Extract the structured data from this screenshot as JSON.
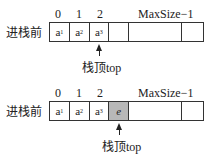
{
  "rows": [
    {
      "label": "进栈前",
      "indices": [
        "0",
        "1",
        "2"
      ],
      "max_label": "MaxSize−1",
      "cells": [
        {
          "base": "a",
          "sub": "1"
        },
        {
          "base": "a",
          "sub": "2"
        },
        {
          "base": "a",
          "sub": "3"
        },
        {
          "base": "",
          "sub": ""
        },
        {
          "base": "",
          "sub": ""
        },
        {
          "base": "",
          "sub": ""
        }
      ],
      "pointer_label": "栈顶top"
    },
    {
      "label": "进栈前",
      "indices": [
        "0",
        "1",
        "2"
      ],
      "max_label": "MaxSize−1",
      "cells": [
        {
          "base": "a",
          "sub": "1"
        },
        {
          "base": "a",
          "sub": "2"
        },
        {
          "base": "a",
          "sub": "3"
        },
        {
          "base": "e",
          "sub": "",
          "highlight": true
        },
        {
          "base": "",
          "sub": ""
        },
        {
          "base": "",
          "sub": ""
        }
      ],
      "pointer_label": "栈顶top"
    }
  ],
  "colors": {
    "highlight": "#b8b8b8",
    "line": "#333333"
  }
}
